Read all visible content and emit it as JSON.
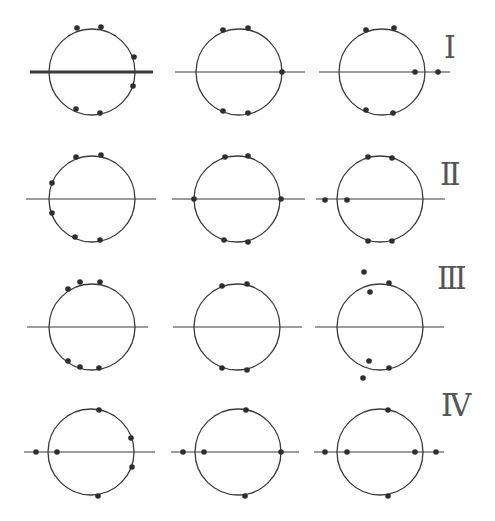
{
  "figure": {
    "background": "#ffffff",
    "stroke_color": "#3a3a3a",
    "dot_color": "#2e2e2e",
    "radius": 43,
    "rows": [
      {
        "label": "I",
        "label_pos": [
          452,
          50
        ],
        "cy": 72,
        "panels": [
          {
            "cx": 92,
            "axis": [
              30,
              153
            ],
            "thick_axis": true,
            "dots": [
              [
                77,
                28
              ],
              [
                101,
                27
              ],
              [
                134,
                57
              ],
              [
                133,
                86
              ],
              [
                76,
                109
              ],
              [
                100,
                113
              ]
            ]
          },
          {
            "cx": 239,
            "axis": [
              175,
              305
            ],
            "thick_axis": false,
            "dots": [
              [
                223,
                30
              ],
              [
                248,
                28
              ],
              [
                282,
                72
              ],
              [
                223,
                111
              ],
              [
                248,
                113
              ]
            ]
          },
          {
            "cx": 382,
            "axis": [
              319,
              450
            ],
            "thick_axis": false,
            "dots": [
              [
                366,
                30
              ],
              [
                394,
                28
              ],
              [
                415,
                72
              ],
              [
                438,
                72
              ],
              [
                366,
                110
              ],
              [
                393,
                113
              ]
            ]
          }
        ]
      },
      {
        "label": "II",
        "label_pos": [
          448,
          177
        ],
        "cy": 199,
        "panels": [
          {
            "cx": 92,
            "axis": [
              26,
              156
            ],
            "thick_axis": false,
            "dots": [
              [
                76,
                157
              ],
              [
                101,
                155
              ],
              [
                52,
                183
              ],
              [
                52,
                213
              ],
              [
                75,
                237
              ],
              [
                100,
                240
              ]
            ]
          },
          {
            "cx": 237,
            "axis": [
              172,
              305
            ],
            "thick_axis": false,
            "dots": [
              [
                225,
                157
              ],
              [
                248,
                156
              ],
              [
                194,
                199
              ],
              [
                281,
                199
              ],
              [
                224,
                240
              ],
              [
                248,
                242
              ]
            ]
          },
          {
            "cx": 380,
            "axis": [
              316,
              445
            ],
            "thick_axis": false,
            "dots": [
              [
                368,
                157
              ],
              [
                392,
                158
              ],
              [
                325,
                200
              ],
              [
                347,
                200
              ],
              [
                368,
                241
              ],
              [
                392,
                241
              ]
            ]
          }
        ]
      },
      {
        "label": "III",
        "label_pos": [
          445,
          281
        ],
        "cy": 327,
        "panels": [
          {
            "cx": 92,
            "axis": [
              27,
              148
            ],
            "thick_axis": false,
            "dots": [
              [
                68,
                289
              ],
              [
                80,
                282
              ],
              [
                100,
                282
              ],
              [
                68,
                361
              ],
              [
                80,
                367
              ],
              [
                99,
                368
              ]
            ]
          },
          {
            "cx": 237,
            "axis": [
              173,
              302
            ],
            "thick_axis": false,
            "dots": [
              [
                222,
                286
              ],
              [
                247,
                284
              ],
              [
                222,
                368
              ],
              [
                247,
                370
              ]
            ]
          },
          {
            "cx": 380,
            "axis": [
              315,
              444
            ],
            "thick_axis": false,
            "dots": [
              [
                364,
                272
              ],
              [
                370,
                292
              ],
              [
                389,
                283
              ],
              [
                369,
                361
              ],
              [
                389,
                368
              ],
              [
                363,
                378
              ]
            ]
          }
        ]
      },
      {
        "label": "IV",
        "label_pos": [
          449,
          408
        ],
        "cy": 452,
        "panels": [
          {
            "cx": 91,
            "axis": [
              24,
              155
            ],
            "thick_axis": false,
            "dots": [
              [
                99,
                410
              ],
              [
                36,
                452
              ],
              [
                57,
                452
              ],
              [
                131,
                438
              ],
              [
                132,
                467
              ],
              [
                98,
                496
              ]
            ]
          },
          {
            "cx": 238,
            "axis": [
              171,
              299
            ],
            "thick_axis": false,
            "dots": [
              [
                246,
                410
              ],
              [
                183,
                452
              ],
              [
                204,
                452
              ],
              [
                281,
                452
              ],
              [
                245,
                496
              ]
            ]
          },
          {
            "cx": 380,
            "axis": [
              314,
              444
            ],
            "thick_axis": false,
            "dots": [
              [
                388,
                410
              ],
              [
                325,
                452
              ],
              [
                347,
                452
              ],
              [
                415,
                452
              ],
              [
                436,
                452
              ],
              [
                388,
                496
              ]
            ]
          }
        ]
      }
    ]
  }
}
